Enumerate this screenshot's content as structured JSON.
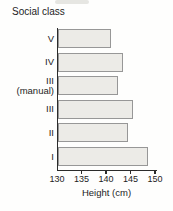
{
  "chart_data": {
    "type": "bar",
    "orientation": "horizontal",
    "title": "Social class",
    "categories": [
      "V",
      "IV",
      "III (manual)",
      "III",
      "II",
      "I"
    ],
    "values": [
      141,
      143.5,
      142.5,
      145.5,
      144.5,
      148.5
    ],
    "xlabel": "Height (cm)",
    "xlim": [
      130,
      150
    ],
    "xticks": [
      130,
      135,
      140,
      145,
      150
    ],
    "grid": false,
    "legend": false,
    "bar_fill": "#ecebe7",
    "bar_border": "#979797",
    "axis_color": "#2b2b2b",
    "text_color": "#1d1d1d"
  }
}
